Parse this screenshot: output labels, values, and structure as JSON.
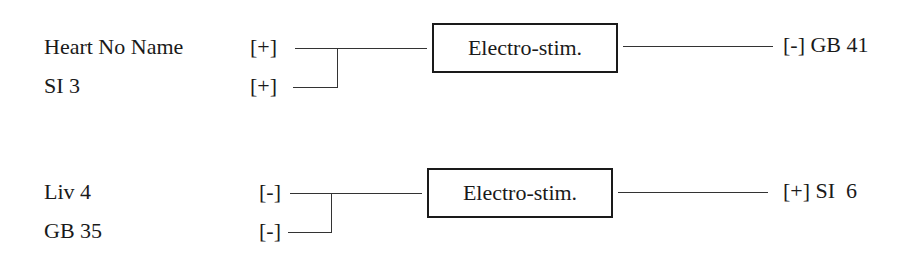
{
  "diagrams": [
    {
      "inputs": [
        {
          "label": "Heart No Name",
          "polarity": "[+]"
        },
        {
          "label": "SI 3",
          "polarity": "[+]"
        }
      ],
      "device": "Electro-stim.",
      "output": {
        "polarity": "[-]",
        "label": "GB 41",
        "text": "[-] GB 41"
      }
    },
    {
      "inputs": [
        {
          "label": "Liv 4",
          "polarity": "[-]"
        },
        {
          "label": "GB 35",
          "polarity": "[-]"
        }
      ],
      "device": "Electro-stim.",
      "output": {
        "polarity": "[+]",
        "label": "SI  6",
        "text": "[+] SI  6"
      }
    }
  ]
}
